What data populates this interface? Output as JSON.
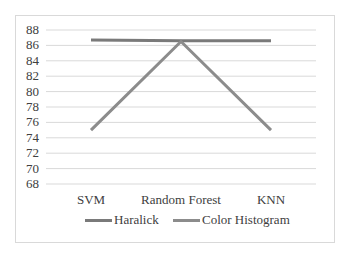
{
  "chart_data": {
    "type": "line",
    "title": "",
    "xlabel": "",
    "ylabel": "",
    "categories": [
      "SVM",
      "Random Forest",
      "KNN"
    ],
    "series": [
      {
        "name": "Haralick",
        "values": [
          86.7,
          86.6,
          86.6
        ],
        "color": "#7a7a7a"
      },
      {
        "name": "Color Histogram",
        "values": [
          75.0,
          86.5,
          75.0
        ],
        "color": "#8c8c8c"
      }
    ],
    "ylim": [
      68,
      88
    ],
    "yticks": [
      "88",
      "86",
      "84",
      "82",
      "80",
      "78",
      "76",
      "74",
      "72",
      "70",
      "68"
    ],
    "grid": true,
    "legend_position": "bottom"
  }
}
